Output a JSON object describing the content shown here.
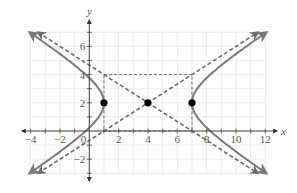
{
  "chart_data": {
    "type": "line",
    "title": "",
    "xlabel": "x",
    "ylabel": "y",
    "xlim": [
      -4,
      12
    ],
    "ylim": [
      -3,
      7
    ],
    "grid": true,
    "x_ticks": [
      -4,
      -2,
      2,
      4,
      6,
      8,
      10,
      12
    ],
    "y_ticks": [
      -2,
      2,
      4,
      6
    ],
    "origin_label": "0",
    "equation": "(x-4)^2/9 - (y-2)^2/4 = 1",
    "center": [
      4,
      2
    ],
    "vertices": [
      [
        1,
        2
      ],
      [
        7,
        2
      ]
    ],
    "fundamental_rectangle": {
      "x": [
        1,
        7
      ],
      "y": [
        0,
        4
      ]
    },
    "series": [
      {
        "name": "hyperbola-left-branch",
        "style": "solid",
        "x": [
          -4.08,
          -2.708,
          -1.408,
          -0.243,
          0.646,
          1,
          0.646,
          -0.243,
          -1.408,
          -2.708,
          -4.08
        ],
        "y": [
          7,
          6,
          5,
          4,
          3,
          2,
          1,
          0,
          -1,
          -2,
          -3
        ]
      },
      {
        "name": "hyperbola-right-branch",
        "style": "solid",
        "x": [
          12.08,
          10.708,
          9.408,
          8.243,
          7.354,
          7,
          7.354,
          8.243,
          9.408,
          10.708,
          12.08
        ],
        "y": [
          7,
          6,
          5,
          4,
          3,
          2,
          1,
          0,
          -1,
          -2,
          -3
        ]
      },
      {
        "name": "asymptote-1",
        "style": "dashed",
        "equation": "y - 2 = (2/3)(x - 4)",
        "x": [
          -3.5,
          11.5
        ],
        "y": [
          -3,
          7
        ]
      },
      {
        "name": "asymptote-2",
        "style": "dashed",
        "equation": "y - 2 = -(2/3)(x - 4)",
        "x": [
          -3.5,
          11.5
        ],
        "y": [
          7,
          -3
        ]
      }
    ],
    "points": [
      {
        "name": "vertex-left",
        "x": 1,
        "y": 2
      },
      {
        "name": "center",
        "x": 4,
        "y": 2
      },
      {
        "name": "vertex-right",
        "x": 7,
        "y": 2
      }
    ]
  },
  "colors": {
    "curve": "#7a7a7a",
    "dashed": "#6a6a6a",
    "grid": "#e4e4e4",
    "axis": "#555555",
    "point": "#000000"
  }
}
